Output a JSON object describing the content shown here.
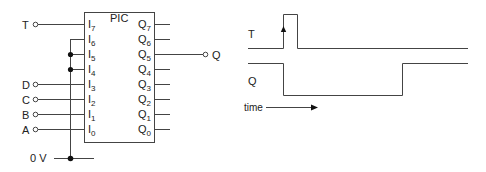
{
  "circuit": {
    "chip_label": "PIC",
    "inputs": [
      {
        "name": "I7",
        "base": "I",
        "sub": "7",
        "signal": "T"
      },
      {
        "name": "I6",
        "base": "I",
        "sub": "6",
        "signal": ""
      },
      {
        "name": "I5",
        "base": "I",
        "sub": "5",
        "signal": ""
      },
      {
        "name": "I4",
        "base": "I",
        "sub": "4",
        "signal": ""
      },
      {
        "name": "I3",
        "base": "I",
        "sub": "3",
        "signal": "D"
      },
      {
        "name": "I2",
        "base": "I",
        "sub": "2",
        "signal": "C"
      },
      {
        "name": "I1",
        "base": "I",
        "sub": "1",
        "signal": "B"
      },
      {
        "name": "I0",
        "base": "I",
        "sub": "0",
        "signal": "A"
      }
    ],
    "outputs": [
      {
        "name": "Q7",
        "base": "Q",
        "sub": "7",
        "signal": ""
      },
      {
        "name": "Q6",
        "base": "Q",
        "sub": "6",
        "signal": ""
      },
      {
        "name": "Q5",
        "base": "Q",
        "sub": "5",
        "signal": "Q"
      },
      {
        "name": "Q4",
        "base": "Q",
        "sub": "4",
        "signal": ""
      },
      {
        "name": "Q3",
        "base": "Q",
        "sub": "3",
        "signal": ""
      },
      {
        "name": "Q2",
        "base": "Q",
        "sub": "2",
        "signal": ""
      },
      {
        "name": "Q1",
        "base": "Q",
        "sub": "1",
        "signal": ""
      },
      {
        "name": "Q0",
        "base": "Q",
        "sub": "0",
        "signal": ""
      }
    ],
    "ground_label": "0 V"
  },
  "timing": {
    "signal_T_label": "T",
    "signal_Q_label": "Q",
    "time_axis_label": "time"
  },
  "colors": {
    "line": "#444444",
    "text": "#222222"
  }
}
